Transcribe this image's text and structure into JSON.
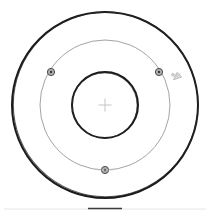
{
  "canvas": {
    "width": 210,
    "height": 217,
    "background": "#ffffff",
    "title": "concentric-circles-sketch"
  },
  "geometry": {
    "center": {
      "x": 105,
      "y": 105
    },
    "circles": [
      {
        "name": "outer-circle",
        "radius": 93,
        "stroke": "#1a1a1a",
        "stroke_width": 2.0,
        "style": "bold-sketch"
      },
      {
        "name": "middle-circle",
        "radius": 65,
        "stroke": "#8c8c8c",
        "stroke_width": 0.8,
        "style": "thin-construction"
      },
      {
        "name": "inner-circle",
        "radius": 33,
        "stroke": "#1a1a1a",
        "stroke_width": 2.0,
        "style": "bold-sketch"
      }
    ],
    "center_marker": {
      "name": "center-crosshair",
      "x": 105,
      "y": 105,
      "size": 13,
      "stroke": "#c4c4c4",
      "stroke_width": 1.0
    },
    "nodes": [
      {
        "name": "node-upper-left",
        "x": 51,
        "y": 72,
        "angle_deg": 135,
        "radius": 3.6,
        "fill": "#b0b0b0",
        "stroke": "#4a4a4a"
      },
      {
        "name": "node-upper-right",
        "x": 159,
        "y": 72,
        "angle_deg": 45,
        "radius": 3.6,
        "fill": "#b0b0b0",
        "stroke": "#4a4a4a"
      },
      {
        "name": "node-bottom",
        "x": 105,
        "y": 170,
        "angle_deg": 270,
        "radius": 3.6,
        "fill": "#b0b0b0",
        "stroke": "#4a4a4a"
      }
    ],
    "cursor": {
      "name": "cursor-arrow",
      "x": 170,
      "y": 75,
      "rotation_deg": -35,
      "fill": "#d8d8d8",
      "stroke": "#9a9a9a"
    },
    "baseline": {
      "name": "footer-baseline",
      "x1": 4,
      "x2": 206,
      "y": 209,
      "stroke": "#e6e6e6",
      "stroke_width": 1.0,
      "accent_x1": 88,
      "accent_x2": 122,
      "accent_stroke": "#3d3d3d"
    }
  },
  "labels": {
    "node_count": "3",
    "circle_count": "3"
  }
}
